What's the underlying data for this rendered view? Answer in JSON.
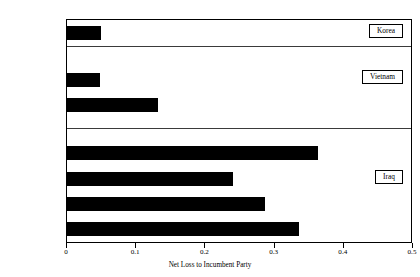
{
  "chart_data": {
    "type": "bar",
    "orientation": "horizontal",
    "title": "",
    "xlabel": "Net Loss to Incumbent Party",
    "ylabel": "",
    "xlim": [
      0,
      0.5
    ],
    "xticks": [
      "0",
      "0.1",
      "0.2",
      "0.3",
      "0.4",
      "0.5"
    ],
    "xtick_values": [
      0,
      0.1,
      0.2,
      0.3,
      0.4,
      0.5
    ],
    "grid": false,
    "legend_position": "inside-right",
    "bar_color": "#000000",
    "categories": [
      "1952 NES",
      "1968 NES",
      "1972 NES",
      "2004 ABC News",
      "2004 PEW",
      "2004 CBS News",
      "2004 NES"
    ],
    "values": [
      0.049,
      0.048,
      0.131,
      0.363,
      0.24,
      0.286,
      0.335
    ],
    "groups": [
      {
        "label": "Korea",
        "categories": [
          "1952 NES"
        ]
      },
      {
        "label": "Vietnam",
        "categories": [
          "1968 NES",
          "1972 NES"
        ]
      },
      {
        "label": "Iraq",
        "categories": [
          "2004 ABC News",
          "2004 PEW",
          "2004 CBS News",
          "2004 NES"
        ]
      }
    ]
  },
  "bars": [
    {
      "label": "1952 NES",
      "value": 0.049,
      "top": 6,
      "era": "Korea"
    },
    {
      "label": "1968 NES",
      "value": 0.048,
      "top": 53,
      "era": "Vietnam"
    },
    {
      "label": "1972 NES",
      "value": 0.131,
      "top": 78,
      "era": "Vietnam"
    },
    {
      "label": "2004 ABC News",
      "value": 0.363,
      "top": 126,
      "era": "Iraq"
    },
    {
      "label": "2004 PEW",
      "value": 0.24,
      "top": 152,
      "era": "Iraq"
    },
    {
      "label": "2004 CBS News",
      "value": 0.286,
      "top": 177,
      "era": "Iraq"
    },
    {
      "label": "2004 NES",
      "value": 0.335,
      "top": 202,
      "era": "Iraq"
    }
  ],
  "dividers": [
    26,
    108
  ],
  "era_boxes": [
    {
      "label": "Korea",
      "top": 4,
      "right": 8
    },
    {
      "label": "Vietnam",
      "top": 50,
      "right": 8
    },
    {
      "label": "Iraq",
      "top": 150,
      "right": 8
    }
  ],
  "axis": {
    "x_label": "Net Loss to Incumbent Party",
    "ticks": [
      {
        "label": "0",
        "value": 0.0
      },
      {
        "label": "0.1",
        "value": 0.1
      },
      {
        "label": "0.2",
        "value": 0.2
      },
      {
        "label": "0.3",
        "value": 0.3
      },
      {
        "label": "0.4",
        "value": 0.4
      },
      {
        "label": "0.5",
        "value": 0.5
      }
    ]
  }
}
